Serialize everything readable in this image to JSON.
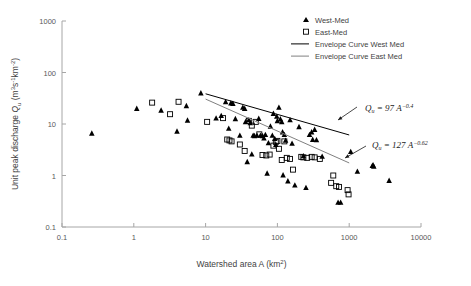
{
  "chart_data": {
    "type": "scatter",
    "title": "",
    "xlabel": "Watershed area A (km2)",
    "xlabel_parts": {
      "text": "Watershed area A (km",
      "sup": "2",
      "tail": ")"
    },
    "ylabel": "Unit peak discharge Qu (m3s-1km-2)",
    "ylabel_parts": {
      "pre": "Unit peak discharge ",
      "q": "Q",
      "qsub": "u",
      "open": " (m",
      "sup1": "3",
      "s": "s",
      "sup2": "-1",
      "km": "km",
      "sup3": "-2",
      "close": ")"
    },
    "xscale": "log",
    "yscale": "log",
    "xlim": [
      0.1,
      10000
    ],
    "ylim": [
      0.1,
      1000
    ],
    "xticks": [
      "0.1",
      "1",
      "10",
      "100",
      "1000",
      "10000"
    ],
    "yticks": [
      "0.1",
      "1",
      "10",
      "100",
      "1000"
    ],
    "grid": false,
    "legend_position": "top-right",
    "series": [
      {
        "name": "West-Med",
        "marker": "filled-triangle",
        "color": "#000000",
        "points": [
          [
            0.26,
            6.6
          ],
          [
            1.1,
            20.0
          ],
          [
            2.4,
            18.5
          ],
          [
            4.0,
            7.2
          ],
          [
            5.4,
            22.5
          ],
          [
            5.6,
            11.8
          ],
          [
            8.6,
            40.0
          ],
          [
            14.0,
            13.0
          ],
          [
            16.5,
            14.5
          ],
          [
            19.0,
            27.0
          ],
          [
            21.0,
            8.2
          ],
          [
            22.5,
            25.5
          ],
          [
            24.0,
            25.0
          ],
          [
            26.0,
            12.6
          ],
          [
            30.0,
            6.0
          ],
          [
            33.0,
            21.0
          ],
          [
            35.0,
            20.0
          ],
          [
            36.0,
            11.0
          ],
          [
            38.0,
            1.85
          ],
          [
            40.0,
            12.0
          ],
          [
            42.0,
            10.5
          ],
          [
            44.0,
            2.6
          ],
          [
            46.0,
            6.0
          ],
          [
            48.0,
            5.9
          ],
          [
            52.0,
            6.0
          ],
          [
            55.0,
            12.8
          ],
          [
            58.0,
            6.0
          ],
          [
            62.0,
            5.9
          ],
          [
            65.0,
            5.3
          ],
          [
            68.0,
            6.2
          ],
          [
            72.0,
            1.1
          ],
          [
            75.0,
            4.3
          ],
          [
            80.0,
            9.0
          ],
          [
            85.0,
            6.0
          ],
          [
            88.0,
            16.0
          ],
          [
            92.0,
            5.2
          ],
          [
            95.0,
            4.0
          ],
          [
            98.0,
            14.0
          ],
          [
            100.0,
            11.5
          ],
          [
            105.0,
            21.0
          ],
          [
            110.0,
            12.5
          ],
          [
            115.0,
            11.0
          ],
          [
            118.0,
            7.0
          ],
          [
            120.0,
            1.02
          ],
          [
            125.0,
            6.2
          ],
          [
            130.0,
            4.8
          ],
          [
            140.0,
            0.78
          ],
          [
            150.0,
            12.0
          ],
          [
            160.0,
            4.2
          ],
          [
            175.0,
            0.65
          ],
          [
            200.0,
            8.8
          ],
          [
            230.0,
            2.4
          ],
          [
            250.0,
            0.58
          ],
          [
            280.0,
            6.2
          ],
          [
            300.0,
            7.0
          ],
          [
            310.0,
            5.0
          ],
          [
            330.0,
            7.8
          ],
          [
            350.0,
            4.9
          ],
          [
            420.0,
            2.35
          ],
          [
            700.0,
            0.3
          ],
          [
            760.0,
            0.3
          ],
          [
            1050.0,
            2.9
          ],
          [
            1300.0,
            1.2
          ],
          [
            2100.0,
            1.55
          ],
          [
            2150.0,
            1.6
          ],
          [
            2200.0,
            1.5
          ],
          [
            3600.0,
            0.8
          ]
        ]
      },
      {
        "name": "East-Med",
        "marker": "open-square",
        "color": "#000000",
        "points": [
          [
            1.8,
            26.0
          ],
          [
            3.2,
            15.5
          ],
          [
            4.2,
            27.0
          ],
          [
            10.5,
            11.0
          ],
          [
            17.5,
            13.0
          ],
          [
            20.0,
            5.0
          ],
          [
            21.5,
            4.8
          ],
          [
            23.0,
            4.6
          ],
          [
            30.0,
            4.0
          ],
          [
            35.0,
            3.0
          ],
          [
            40.0,
            11.5
          ],
          [
            44.0,
            9.3
          ],
          [
            50.0,
            11.0
          ],
          [
            56.0,
            6.3
          ],
          [
            62.0,
            2.5
          ],
          [
            70.0,
            2.45
          ],
          [
            78.0,
            2.55
          ],
          [
            88.0,
            3.8
          ],
          [
            95.0,
            4.5
          ],
          [
            100.0,
            4.7
          ],
          [
            105.0,
            3.3
          ],
          [
            115.0,
            2.0
          ],
          [
            125.0,
            4.6
          ],
          [
            135.0,
            2.2
          ],
          [
            150.0,
            2.1
          ],
          [
            165.0,
            1.3
          ],
          [
            215.0,
            2.3
          ],
          [
            230.0,
            2.25
          ],
          [
            260.0,
            2.2
          ],
          [
            300.0,
            2.3
          ],
          [
            330.0,
            2.25
          ],
          [
            390.0,
            2.1
          ],
          [
            560.0,
            0.72
          ],
          [
            600.0,
            1.0
          ],
          [
            660.0,
            0.62
          ],
          [
            720.0,
            0.6
          ],
          [
            950.0,
            0.52
          ],
          [
            980.0,
            0.43
          ]
        ]
      }
    ],
    "envelope_curves": [
      {
        "name": "Envelope Curve West Med",
        "equation": "Qu = 97 A^-0.4",
        "coefficient": 97,
        "exponent": -0.4,
        "color": "#000000",
        "x_range": [
          10,
          1000
        ]
      },
      {
        "name": "Envelope Curve East Med",
        "equation": "Qu = 127 A^-0.62",
        "coefficient": 127,
        "exponent": -0.62,
        "color": "#808080",
        "x_range": [
          10,
          1000
        ]
      }
    ],
    "annotations": [
      {
        "label": "Qu = 97 A-0.4",
        "q": "Q",
        "sub": "u",
        "eq": " = 97 ",
        "a": "A",
        "sup": "−0.4",
        "target_x": 1000,
        "target_y": 6.1
      },
      {
        "label": "Qu = 127 A-0.62",
        "q": "Q",
        "sub": "u",
        "eq": " = 127 ",
        "a": "A",
        "sup": "−0.62",
        "target_x": 1000,
        "target_y": 1.65
      }
    ],
    "legend": [
      {
        "label": "West-Med",
        "marker": "filled-triangle"
      },
      {
        "label": "East-Med",
        "marker": "open-square"
      },
      {
        "label": "Envelope Curve West Med",
        "marker": "line-black"
      },
      {
        "label": "Envelope Curve East  Med",
        "marker": "line-gray"
      }
    ]
  },
  "colors": {
    "axis": "#a6a6a6",
    "text": "#3f3f3f",
    "marker": "#000000",
    "envelope_west": "#000000",
    "envelope_east": "#808080",
    "background": "#ffffff"
  }
}
